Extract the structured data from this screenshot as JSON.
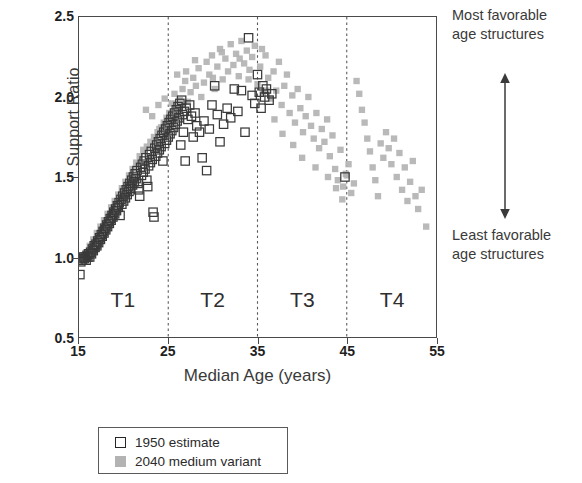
{
  "chart_data": {
    "type": "scatter",
    "title": "",
    "xlabel": "Median Age (years)",
    "ylabel": "Support Ratio",
    "xlim": [
      15,
      55
    ],
    "ylim": [
      0.5,
      2.5
    ],
    "xticks": [
      "15",
      "25",
      "35",
      "45",
      "55"
    ],
    "yticks": [
      "0.5",
      "1.0",
      "1.5",
      "2.0",
      "2.5"
    ],
    "xtick_values": [
      15,
      25,
      35,
      45,
      55
    ],
    "ytick_values": [
      0.5,
      1.0,
      1.5,
      2.0,
      2.5
    ],
    "grid": false,
    "legend_position": "below-plot",
    "region_dividers": [
      25,
      35,
      45
    ],
    "regions": [
      {
        "label": "T1",
        "center": 20
      },
      {
        "label": "T2",
        "center": 30
      },
      {
        "label": "T3",
        "center": 40
      },
      {
        "label": "T4",
        "center": 50
      }
    ],
    "annotations": [
      {
        "name": "most-favorable",
        "line1": "Most favorable",
        "line2": "age structures"
      },
      {
        "name": "least-favorable",
        "line1": "Least favorable",
        "line2": "age structures"
      }
    ],
    "series": [
      {
        "name": "1950 estimate",
        "marker": "open-square",
        "color": "#3a3a3a",
        "points": [
          [
            15.1,
            0.89
          ],
          [
            15.2,
            0.97
          ],
          [
            15.3,
            0.99
          ],
          [
            15.4,
            0.98
          ],
          [
            15.5,
            1.0
          ],
          [
            15.6,
            0.99
          ],
          [
            15.7,
            1.0
          ],
          [
            15.8,
            0.98
          ],
          [
            15.9,
            1.01
          ],
          [
            16.0,
            1.0
          ],
          [
            16.1,
            1.02
          ],
          [
            16.2,
            1.0
          ],
          [
            16.3,
            1.03
          ],
          [
            16.4,
            1.02
          ],
          [
            16.5,
            1.05
          ],
          [
            16.6,
            1.04
          ],
          [
            16.7,
            1.07
          ],
          [
            16.8,
            1.06
          ],
          [
            16.9,
            1.08
          ],
          [
            17.0,
            1.07
          ],
          [
            17.1,
            1.1
          ],
          [
            17.2,
            1.09
          ],
          [
            17.3,
            1.12
          ],
          [
            17.4,
            1.11
          ],
          [
            17.5,
            1.14
          ],
          [
            17.6,
            1.13
          ],
          [
            17.7,
            1.16
          ],
          [
            17.8,
            1.15
          ],
          [
            17.9,
            1.18
          ],
          [
            18.0,
            1.17
          ],
          [
            18.1,
            1.2
          ],
          [
            18.2,
            1.19
          ],
          [
            18.3,
            1.22
          ],
          [
            18.4,
            1.21
          ],
          [
            18.5,
            1.24
          ],
          [
            18.6,
            1.23
          ],
          [
            18.7,
            1.26
          ],
          [
            18.8,
            1.25
          ],
          [
            18.9,
            1.28
          ],
          [
            19.0,
            1.27
          ],
          [
            19.1,
            1.3
          ],
          [
            19.2,
            1.29
          ],
          [
            19.3,
            1.32
          ],
          [
            19.4,
            1.31
          ],
          [
            19.5,
            1.34
          ],
          [
            19.6,
            1.26
          ],
          [
            19.7,
            1.36
          ],
          [
            19.8,
            1.33
          ],
          [
            19.9,
            1.38
          ],
          [
            20.0,
            1.35
          ],
          [
            20.1,
            1.4
          ],
          [
            20.2,
            1.37
          ],
          [
            20.3,
            1.42
          ],
          [
            20.4,
            1.39
          ],
          [
            20.5,
            1.44
          ],
          [
            20.6,
            1.41
          ],
          [
            20.7,
            1.46
          ],
          [
            20.8,
            1.43
          ],
          [
            20.9,
            1.48
          ],
          [
            21.0,
            1.45
          ],
          [
            21.1,
            1.5
          ],
          [
            21.2,
            1.47
          ],
          [
            21.3,
            1.52
          ],
          [
            21.4,
            1.49
          ],
          [
            21.5,
            1.54
          ],
          [
            21.6,
            1.46
          ],
          [
            21.7,
            1.42
          ],
          [
            21.8,
            1.38
          ],
          [
            21.9,
            1.56
          ],
          [
            22.0,
            1.51
          ],
          [
            22.1,
            1.58
          ],
          [
            22.2,
            1.53
          ],
          [
            22.3,
            1.6
          ],
          [
            22.4,
            1.55
          ],
          [
            22.5,
            1.62
          ],
          [
            22.6,
            1.48
          ],
          [
            22.7,
            1.44
          ],
          [
            22.8,
            1.57
          ],
          [
            22.9,
            1.64
          ],
          [
            23.0,
            1.59
          ],
          [
            23.1,
            1.66
          ],
          [
            23.2,
            1.61
          ],
          [
            23.3,
            1.28
          ],
          [
            23.4,
            1.25
          ],
          [
            23.5,
            1.68
          ],
          [
            23.6,
            1.63
          ],
          [
            23.7,
            1.7
          ],
          [
            23.8,
            1.65
          ],
          [
            23.9,
            1.72
          ],
          [
            24.0,
            1.67
          ],
          [
            24.1,
            1.74
          ],
          [
            24.2,
            1.69
          ],
          [
            24.3,
            1.76
          ],
          [
            24.4,
            1.6
          ],
          [
            24.5,
            1.78
          ],
          [
            24.6,
            1.71
          ],
          [
            24.7,
            1.8
          ],
          [
            24.8,
            1.73
          ],
          [
            24.9,
            1.82
          ],
          [
            25.0,
            1.75
          ],
          [
            25.1,
            1.84
          ],
          [
            25.2,
            1.77
          ],
          [
            25.3,
            1.86
          ],
          [
            25.4,
            1.79
          ],
          [
            25.5,
            1.88
          ],
          [
            25.6,
            1.81
          ],
          [
            25.7,
            1.9
          ],
          [
            25.8,
            1.83
          ],
          [
            25.9,
            1.92
          ],
          [
            26.0,
            1.85
          ],
          [
            26.1,
            1.94
          ],
          [
            26.2,
            1.87
          ],
          [
            26.3,
            1.96
          ],
          [
            26.4,
            1.7
          ],
          [
            26.5,
            1.98
          ],
          [
            26.6,
            1.89
          ],
          [
            26.7,
            1.78
          ],
          [
            26.8,
            1.91
          ],
          [
            26.9,
            1.6
          ],
          [
            27.0,
            1.93
          ],
          [
            27.2,
            1.86
          ],
          [
            27.4,
            1.95
          ],
          [
            27.6,
            1.88
          ],
          [
            27.8,
            1.75
          ],
          [
            28.0,
            1.9
          ],
          [
            28.2,
            1.82
          ],
          [
            28.5,
            1.78
          ],
          [
            28.8,
            1.62
          ],
          [
            29.0,
            1.85
          ],
          [
            29.3,
            1.54
          ],
          [
            29.6,
            1.8
          ],
          [
            29.9,
            1.95
          ],
          [
            30.2,
            2.07
          ],
          [
            30.5,
            1.89
          ],
          [
            30.8,
            1.72
          ],
          [
            31.2,
            1.83
          ],
          [
            31.6,
            1.93
          ],
          [
            32.0,
            1.87
          ],
          [
            32.4,
            2.05
          ],
          [
            32.8,
            1.91
          ],
          [
            33.2,
            2.04
          ],
          [
            33.6,
            1.78
          ],
          [
            34.0,
            2.37
          ],
          [
            34.4,
            2.01
          ],
          [
            34.7,
            1.96
          ],
          [
            35.0,
            2.14
          ],
          [
            35.2,
            2.03
          ],
          [
            35.4,
            1.93
          ],
          [
            35.6,
            2.07
          ],
          [
            35.8,
            2.0
          ],
          [
            36.0,
            2.05
          ],
          [
            36.3,
            1.98
          ],
          [
            36.6,
            2.02
          ],
          [
            44.8,
            1.5
          ]
        ]
      },
      {
        "name": "2040 medium variant",
        "marker": "filled-square",
        "color": "#b3b3b3",
        "points": [
          [
            15.4,
            1.0
          ],
          [
            15.8,
            1.03
          ],
          [
            16.2,
            1.07
          ],
          [
            16.6,
            1.11
          ],
          [
            17.0,
            1.15
          ],
          [
            17.4,
            1.19
          ],
          [
            17.8,
            1.23
          ],
          [
            18.2,
            1.27
          ],
          [
            18.6,
            1.31
          ],
          [
            19.0,
            1.35
          ],
          [
            19.4,
            1.39
          ],
          [
            19.8,
            1.43
          ],
          [
            20.2,
            1.47
          ],
          [
            20.6,
            1.51
          ],
          [
            21.0,
            1.55
          ],
          [
            21.4,
            1.59
          ],
          [
            21.8,
            1.63
          ],
          [
            22.2,
            1.67
          ],
          [
            22.6,
            1.69
          ],
          [
            23.0,
            1.72
          ],
          [
            23.4,
            1.75
          ],
          [
            23.8,
            1.78
          ],
          [
            24.2,
            1.81
          ],
          [
            24.5,
            1.84
          ],
          [
            24.8,
            1.87
          ],
          [
            22.5,
            1.92
          ],
          [
            23.2,
            1.88
          ],
          [
            23.9,
            1.95
          ],
          [
            24.6,
            1.99
          ],
          [
            25.1,
            1.9
          ],
          [
            25.4,
            1.96
          ],
          [
            25.7,
            2.02
          ],
          [
            26.0,
            1.93
          ],
          [
            26.3,
            1.98
          ],
          [
            26.6,
            2.05
          ],
          [
            26.9,
            2.1
          ],
          [
            27.2,
            1.97
          ],
          [
            27.5,
            2.03
          ],
          [
            27.8,
            2.12
          ],
          [
            28.1,
            2.07
          ],
          [
            28.4,
            2.18
          ],
          [
            28.7,
            2.0
          ],
          [
            29.0,
            2.09
          ],
          [
            29.3,
            2.22
          ],
          [
            29.6,
            2.14
          ],
          [
            29.9,
            2.26
          ],
          [
            30.2,
            2.05
          ],
          [
            30.5,
            2.19
          ],
          [
            30.8,
            2.3
          ],
          [
            31.1,
            2.11
          ],
          [
            31.4,
            2.24
          ],
          [
            31.7,
            2.16
          ],
          [
            32.0,
            2.33
          ],
          [
            32.3,
            2.2
          ],
          [
            32.6,
            2.27
          ],
          [
            32.9,
            2.13
          ],
          [
            33.2,
            2.35
          ],
          [
            33.5,
            2.21
          ],
          [
            33.8,
            2.29
          ],
          [
            34.1,
            2.17
          ],
          [
            34.4,
            2.25
          ],
          [
            34.7,
            2.32
          ],
          [
            35.0,
            2.08
          ],
          [
            35.3,
            2.19
          ],
          [
            35.6,
            2.02
          ],
          [
            35.9,
            2.26
          ],
          [
            36.2,
            2.12
          ],
          [
            36.5,
            1.99
          ],
          [
            36.8,
            2.16
          ],
          [
            37.1,
            2.04
          ],
          [
            37.4,
            2.22
          ],
          [
            37.7,
            1.95
          ],
          [
            38.0,
            2.07
          ],
          [
            38.3,
            2.14
          ],
          [
            38.6,
            1.9
          ],
          [
            38.9,
            2.01
          ],
          [
            39.2,
            1.84
          ],
          [
            39.5,
            2.05
          ],
          [
            39.8,
            1.93
          ],
          [
            40.1,
            1.78
          ],
          [
            40.4,
            1.88
          ],
          [
            40.7,
            2.0
          ],
          [
            41.0,
            1.82
          ],
          [
            41.3,
            1.74
          ],
          [
            41.6,
            1.9
          ],
          [
            41.9,
            1.68
          ],
          [
            42.2,
            1.8
          ],
          [
            42.5,
            1.72
          ],
          [
            42.8,
            1.86
          ],
          [
            43.1,
            1.63
          ],
          [
            43.4,
            1.76
          ],
          [
            43.7,
            1.55
          ],
          [
            44.0,
            1.48
          ],
          [
            44.3,
            1.67
          ],
          [
            44.6,
            1.44
          ],
          [
            44.9,
            1.52
          ],
          [
            45.2,
            1.58
          ],
          [
            45.5,
            1.4
          ],
          [
            45.8,
            1.46
          ],
          [
            46.1,
            2.1
          ],
          [
            46.4,
            2.02
          ],
          [
            46.7,
            1.92
          ],
          [
            47.0,
            1.84
          ],
          [
            47.3,
            1.74
          ],
          [
            47.6,
            1.66
          ],
          [
            47.9,
            1.56
          ],
          [
            48.2,
            1.48
          ],
          [
            48.5,
            1.38
          ],
          [
            48.8,
            1.71
          ],
          [
            49.1,
            1.62
          ],
          [
            49.4,
            1.78
          ],
          [
            49.7,
            1.68
          ],
          [
            50.0,
            1.58
          ],
          [
            50.3,
            1.74
          ],
          [
            50.6,
            1.5
          ],
          [
            50.9,
            1.65
          ],
          [
            51.2,
            1.42
          ],
          [
            51.5,
            1.56
          ],
          [
            51.8,
            1.35
          ],
          [
            52.1,
            1.47
          ],
          [
            52.4,
            1.6
          ],
          [
            52.7,
            1.38
          ],
          [
            53.0,
            1.3
          ],
          [
            53.4,
            1.42
          ],
          [
            53.9,
            1.19
          ],
          [
            36.0,
            2.04
          ],
          [
            36.9,
            1.86
          ],
          [
            37.8,
            1.77
          ],
          [
            39.0,
            1.7
          ],
          [
            40.0,
            1.62
          ],
          [
            41.5,
            1.56
          ],
          [
            42.9,
            1.5
          ],
          [
            43.8,
            1.43
          ],
          [
            44.5,
            1.36
          ],
          [
            45.0,
            1.51
          ],
          [
            30.0,
            2.12
          ],
          [
            31.0,
            2.28
          ],
          [
            33.0,
            2.24
          ],
          [
            34.0,
            2.11
          ],
          [
            35.5,
            2.3
          ],
          [
            27.0,
            2.16
          ],
          [
            28.0,
            2.23
          ],
          [
            25.0,
            1.86
          ],
          [
            26.0,
            2.14
          ],
          [
            24.0,
            1.8
          ]
        ]
      }
    ]
  },
  "legend": {
    "entries": [
      {
        "label": "1950 estimate",
        "marker": "open-square"
      },
      {
        "label": "2040 medium variant",
        "marker": "filled-square"
      }
    ]
  },
  "colors": {
    "axis": "#4a4a4a",
    "text": "#2b2b2b",
    "series_1950": "#3a3a3a",
    "series_2040": "#b3b3b3",
    "divider": "#5a5a5a"
  }
}
